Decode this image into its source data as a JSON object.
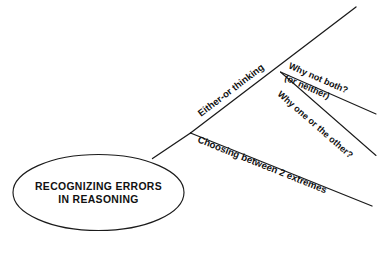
{
  "diagram": {
    "type": "mind-map",
    "background_color": "#ffffff",
    "line_color": "#1b1b1b",
    "text_color": "#111111",
    "root": {
      "shape": "ellipse",
      "line1": "RECOGNIZING ERRORS",
      "line2": "IN REASONING"
    },
    "branches": [
      {
        "id": "either-or-thinking",
        "label": "Either-or thinking",
        "level": 1
      },
      {
        "id": "why-not-both",
        "label": "Why not both?",
        "label_line2": "(or neither)",
        "level": 2
      },
      {
        "id": "why-one-or-the-other",
        "label": "Why one or the other?",
        "level": 2
      },
      {
        "id": "choosing-between-2-extremes",
        "label": "Choosing between 2 extremes",
        "level": 1
      }
    ]
  }
}
